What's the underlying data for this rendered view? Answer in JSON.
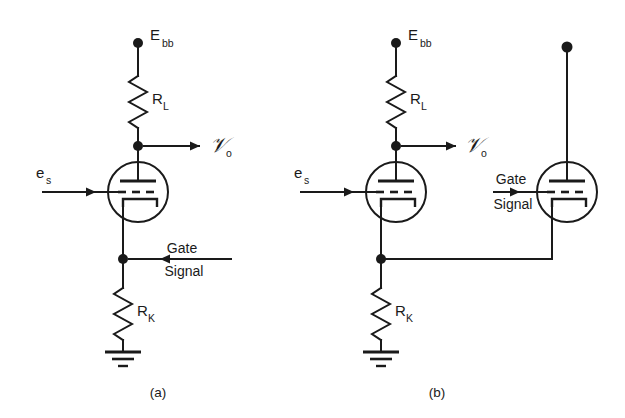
{
  "figure": {
    "panels": [
      {
        "id": "a",
        "caption": "(a)",
        "supply_label": "E",
        "supply_sub": "bb",
        "plate_resistor_label": "R",
        "plate_resistor_sub": "L",
        "cathode_resistor_label": "R",
        "cathode_resistor_sub": "K",
        "input_label": "e",
        "input_sub": "s",
        "output_label": "\u0001d4b1",
        "output_sub": "o",
        "gate_line1": "Gate",
        "gate_line2": "Signal",
        "gate_arrow_direction": "left",
        "tube_count": 1
      },
      {
        "id": "b",
        "caption": "(b)",
        "supply_label": "E",
        "supply_sub": "bb",
        "plate_resistor_label": "R",
        "plate_resistor_sub": "L",
        "cathode_resistor_label": "R",
        "cathode_resistor_sub": "K",
        "input_label": "e",
        "input_sub": "s",
        "output_label": "\u0001d4b1",
        "output_sub": "o",
        "gate_line1": "Gate",
        "gate_line2": "Signal",
        "gate_arrow_direction": "right",
        "tube_count": 2
      }
    ],
    "colors": {
      "ink": "#1a1a1a",
      "background": "#ffffff"
    }
  }
}
